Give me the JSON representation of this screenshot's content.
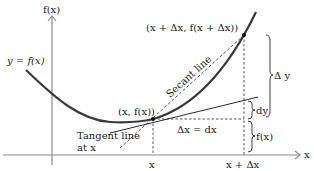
{
  "diagram": {
    "colors": {
      "axis": "#8a8a8a",
      "curve": "#3a3a3a",
      "lines": "#2b2b2b",
      "text": "#222222"
    },
    "axes": {
      "y_label": "f(x)",
      "x_label": "x"
    },
    "curve_label": "y = f(x)",
    "points": {
      "p": "(x, f(x))",
      "q": "(x + Δx, f(x + Δx))"
    },
    "lines": {
      "secant": "Secant line",
      "tangent_line1": "Tangent line",
      "tangent_line2": "at x"
    },
    "ticks": {
      "x": "x",
      "x_plus_dx": "x + Δx"
    },
    "annotations": {
      "delta_x": "Δx = dx",
      "dy": "dy",
      "delta_y": "Δ y",
      "fx": "f(x)"
    }
  }
}
